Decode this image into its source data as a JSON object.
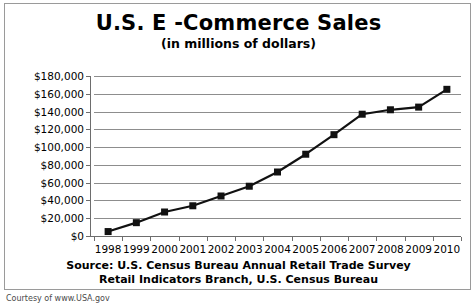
{
  "chart_data": {
    "type": "line",
    "title": "U.S. E -Commerce Sales",
    "subtitle": "(in millions of dollars)",
    "xlabel": "",
    "ylabel": "",
    "categories": [
      "1998",
      "1999",
      "2000",
      "2001",
      "2002",
      "2003",
      "2004",
      "2005",
      "2006",
      "2007",
      "2008",
      "2009",
      "2010"
    ],
    "values": [
      5000,
      15000,
      27000,
      34000,
      45000,
      56000,
      72000,
      92000,
      114000,
      137000,
      142000,
      145000,
      165000
    ],
    "ylim": [
      0,
      180000
    ],
    "ytick_values": [
      0,
      20000,
      40000,
      60000,
      80000,
      100000,
      120000,
      140000,
      160000,
      180000
    ],
    "ytick_labels": [
      "$0",
      "$20,000",
      "$40,000",
      "$60,000",
      "$80,000",
      "$100,000",
      "$120,000",
      "$140,000",
      "$160,000",
      "$180,000"
    ],
    "grid": true,
    "legend": false,
    "marker": "square",
    "series_color": "#111111",
    "grid_color": "#8d8d8d"
  },
  "source": {
    "line1": "Source: U.S. Census Bureau Annual Retail Trade Survey",
    "line2": "Retail Indicators Branch, U.S. Census Bureau"
  },
  "credit": {
    "text": "Courtesy of www.USA.gov"
  }
}
